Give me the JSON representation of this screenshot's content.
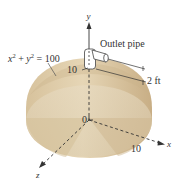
{
  "figure": {
    "equation_label": "x² + y² = 100",
    "equation_parts": {
      "x": "x",
      "y": "y",
      "sup": "2",
      "plus": " + ",
      "eq": " = 100"
    },
    "outlet_label": "Outlet pipe",
    "dimension_label": "2 ft",
    "axis_labels": {
      "x": "x",
      "y": "y",
      "z": "z"
    },
    "tick_labels": {
      "y_top": "10",
      "x_end": "10",
      "origin": "0"
    }
  },
  "colors": {
    "tank_light": "#e8dcc4",
    "tank_mid": "#d9c7a3",
    "tank_dark": "#c9b289",
    "tank_shadow": "#bda27a",
    "axis": "#333333",
    "text": "#333333",
    "pipe": "#ffffff"
  }
}
